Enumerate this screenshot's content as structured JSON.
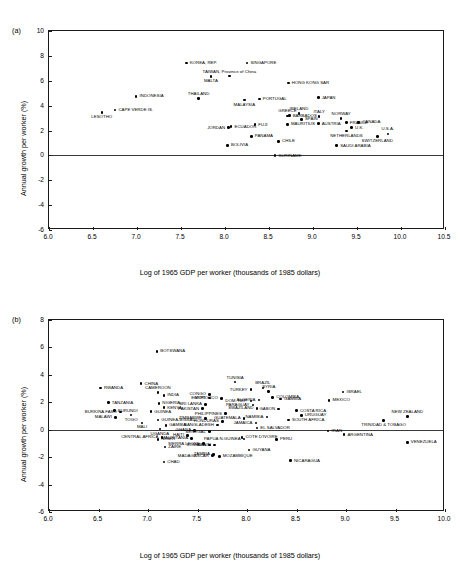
{
  "figure": {
    "panels": [
      {
        "tag": "(a)",
        "xlabel": "Log of 1965 GDP per worker (thousands of 1985 dollars)",
        "ylabel": "Annual growth per worker (%)"
      },
      {
        "tag": "(b)",
        "xlabel": "Log of 1965 GDP per worker (thousands of 1985 dollars)",
        "ylabel": "Annual growth per worker (%)"
      }
    ]
  },
  "chart_data": [
    {
      "type": "scatter",
      "panel": "(a)",
      "title": "",
      "xlabel": "Log of 1965 GDP per worker (thousands of 1985 dollars)",
      "ylabel": "Annual growth per worker (%)",
      "xlim": [
        6.0,
        10.5
      ],
      "ylim": [
        -6,
        10
      ],
      "xticks": [
        "6.0",
        "6.5",
        "7.0",
        "7.5",
        "8.0",
        "8.5",
        "9.0",
        "9.5",
        "10.0",
        "10.5"
      ],
      "yticks": [
        "-6",
        "-4",
        "-2",
        "0",
        "2",
        "4",
        "6",
        "8",
        "10"
      ],
      "grid": false,
      "legend": "none",
      "zero_line": 0,
      "points": [
        {
          "label": "LESOTHO",
          "x": 6.6,
          "y": 3.45,
          "pos": "below"
        },
        {
          "label": "CAPE VERDE IS.",
          "x": 6.75,
          "y": 3.65,
          "pos": "right"
        },
        {
          "label": "INDONESIA",
          "x": 6.99,
          "y": 4.75,
          "pos": "right"
        },
        {
          "label": "THAILAND",
          "x": 7.7,
          "y": 4.55,
          "pos": "above"
        },
        {
          "label": "KOREA, REP.",
          "x": 7.56,
          "y": 7.42,
          "pos": "right"
        },
        {
          "label": "MALTA",
          "x": 7.84,
          "y": 6.32,
          "pos": "below"
        },
        {
          "label": "TAIWAN, Province of China",
          "x": 8.05,
          "y": 6.37,
          "pos": "above"
        },
        {
          "label": "SINGAPORE",
          "x": 8.25,
          "y": 7.43,
          "pos": "right"
        },
        {
          "label": "MALAYSIA",
          "x": 8.22,
          "y": 4.45,
          "pos": "below"
        },
        {
          "label": "PORTUGAL",
          "x": 8.39,
          "y": 4.52,
          "pos": "right"
        },
        {
          "label": "JORDAN",
          "x": 8.04,
          "y": 2.22,
          "pos": "left"
        },
        {
          "label": "ECUADOR",
          "x": 8.07,
          "y": 2.3,
          "pos": "right"
        },
        {
          "label": "FUJI",
          "x": 8.34,
          "y": 2.47,
          "pos": "right"
        },
        {
          "label": "PANAMA",
          "x": 8.3,
          "y": 1.52,
          "pos": "right"
        },
        {
          "label": "BOLIVIA",
          "x": 8.03,
          "y": 0.8,
          "pos": "right"
        },
        {
          "label": "GREECE",
          "x": 8.71,
          "y": 3.18,
          "pos": "above"
        },
        {
          "label": "BARBADOS",
          "x": 8.73,
          "y": 3.2,
          "pos": "right"
        },
        {
          "label": "MAURITIUS",
          "x": 8.71,
          "y": 2.5,
          "pos": "right"
        },
        {
          "label": "CHILE",
          "x": 8.61,
          "y": 1.12,
          "pos": "right"
        },
        {
          "label": "SURINAME",
          "x": 8.57,
          "y": -0.02,
          "pos": "right"
        },
        {
          "label": "HONG KONG SAR",
          "x": 8.72,
          "y": 5.82,
          "pos": "right"
        },
        {
          "label": "JAPAN",
          "x": 9.06,
          "y": 4.63,
          "pos": "right"
        },
        {
          "label": "IRELAND",
          "x": 8.84,
          "y": 3.38,
          "pos": "above"
        },
        {
          "label": "SPAIN",
          "x": 8.87,
          "y": 2.9,
          "pos": "right"
        },
        {
          "label": "ITALY",
          "x": 9.07,
          "y": 3.12,
          "pos": "above"
        },
        {
          "label": "AUSTRIA",
          "x": 9.06,
          "y": 2.55,
          "pos": "right"
        },
        {
          "label": "NORWAY",
          "x": 9.32,
          "y": 2.98,
          "pos": "above"
        },
        {
          "label": "FRANCE",
          "x": 9.38,
          "y": 2.63,
          "pos": "right"
        },
        {
          "label": "CANADA",
          "x": 9.52,
          "y": 2.65,
          "pos": "right"
        },
        {
          "label": "NETHERLANDS",
          "x": 9.38,
          "y": 1.95,
          "pos": "below"
        },
        {
          "label": "U.K.",
          "x": 9.44,
          "y": 2.22,
          "pos": "right"
        },
        {
          "label": "U.S.A.",
          "x": 9.85,
          "y": 1.72,
          "pos": "above"
        },
        {
          "label": "SWITZERLAND",
          "x": 9.73,
          "y": 1.53,
          "pos": "below"
        },
        {
          "label": "SAUDI ARABIA",
          "x": 9.27,
          "y": 0.78,
          "pos": "right"
        }
      ]
    },
    {
      "type": "scatter",
      "panel": "(b)",
      "title": "",
      "xlabel": "Log of 1965 GDP per worker (thousands of 1985 dollars)",
      "ylabel": "Annual growth per worker (%)",
      "xlim": [
        6.0,
        10.0
      ],
      "ylim": [
        -6,
        8
      ],
      "xticks": [
        "6.0",
        "6.5",
        "7.0",
        "7.5",
        "8.0",
        "8.5",
        "9.0",
        "9.5",
        "10.0"
      ],
      "yticks": [
        "-6",
        "-4",
        "-2",
        "0",
        "2",
        "4",
        "6",
        "8"
      ],
      "grid": false,
      "legend": "none",
      "zero_line": 0,
      "points": [
        {
          "label": "BOTSWANA",
          "x": 7.09,
          "y": 5.72,
          "pos": "right"
        },
        {
          "label": "RWANDA",
          "x": 6.52,
          "y": 3.05,
          "pos": "right"
        },
        {
          "label": "CHINA",
          "x": 6.93,
          "y": 3.36,
          "pos": "right"
        },
        {
          "label": "TANZANIA",
          "x": 6.6,
          "y": 1.97,
          "pos": "right"
        },
        {
          "label": "BURKINA FASO",
          "x": 6.72,
          "y": 1.3,
          "pos": "left"
        },
        {
          "label": "BURUNDI",
          "x": 6.66,
          "y": 1.4,
          "pos": "right"
        },
        {
          "label": "MALAWI",
          "x": 6.67,
          "y": 0.9,
          "pos": "left"
        },
        {
          "label": "TOGO",
          "x": 6.83,
          "y": 1.08,
          "pos": "below"
        },
        {
          "label": "MALI",
          "x": 6.94,
          "y": 0.5,
          "pos": "below"
        },
        {
          "label": "CAMEROON",
          "x": 7.1,
          "y": 2.7,
          "pos": "above"
        },
        {
          "label": "INDIA",
          "x": 7.16,
          "y": 2.5,
          "pos": "right"
        },
        {
          "label": "NIGERIA",
          "x": 7.11,
          "y": 1.92,
          "pos": "right"
        },
        {
          "label": "KENYA",
          "x": 7.16,
          "y": 1.6,
          "pos": "right"
        },
        {
          "label": "GUINEA",
          "x": 7.03,
          "y": 1.32,
          "pos": "right"
        },
        {
          "label": "GUINEA-BISSAU",
          "x": 7.1,
          "y": 0.72,
          "pos": "right"
        },
        {
          "label": "GAMBIA",
          "x": 7.18,
          "y": 0.32,
          "pos": "right"
        },
        {
          "label": "UGANDA",
          "x": 7.12,
          "y": 0.05,
          "pos": "below"
        },
        {
          "label": "CENTRAL AFRICA",
          "x": 7.14,
          "y": -0.55,
          "pos": "left"
        },
        {
          "label": "NIGER",
          "x": 7.1,
          "y": -0.7,
          "pos": "right"
        },
        {
          "label": "ZAIRE",
          "x": 7.17,
          "y": -1.25,
          "pos": "right"
        },
        {
          "label": "CHAD",
          "x": 7.16,
          "y": -2.35,
          "pos": "right"
        },
        {
          "label": "SRI LANKA",
          "x": 7.58,
          "y": 1.85,
          "pos": "left"
        },
        {
          "label": "PAKISTAN",
          "x": 7.55,
          "y": 1.53,
          "pos": "left"
        },
        {
          "label": "ZIMBABWE",
          "x": 7.58,
          "y": 0.82,
          "pos": "left"
        },
        {
          "label": "CONGO",
          "x": 7.62,
          "y": 2.58,
          "pos": "left"
        },
        {
          "label": "EGYPT",
          "x": 7.62,
          "y": 2.3,
          "pos": "left"
        },
        {
          "label": "MOROCCO",
          "x": 7.74,
          "y": 2.28,
          "pos": "left"
        },
        {
          "label": "HAITI",
          "x": 7.4,
          "y": -0.42,
          "pos": "left"
        },
        {
          "label": "MAURITANIA",
          "x": 7.44,
          "y": -0.62,
          "pos": "left"
        },
        {
          "label": "GHANA",
          "x": 7.47,
          "y": -0.05,
          "pos": "left"
        },
        {
          "label": "SENEGAL",
          "x": 7.62,
          "y": -0.15,
          "pos": "left"
        },
        {
          "label": "SIERRA LEONE",
          "x": 7.56,
          "y": -1.02,
          "pos": "left"
        },
        {
          "label": "SOMALIA",
          "x": 7.62,
          "y": -1.1,
          "pos": "left"
        },
        {
          "label": "BENIN",
          "x": 7.67,
          "y": -1.1,
          "pos": "left"
        },
        {
          "label": "MADAGASCAR",
          "x": 7.65,
          "y": -1.9,
          "pos": "left"
        },
        {
          "label": "ZAMBIA",
          "x": 7.66,
          "y": -1.8,
          "pos": "left"
        },
        {
          "label": "MOZAMBIQUE",
          "x": 7.72,
          "y": -1.95,
          "pos": "right"
        },
        {
          "label": "TUNISIA",
          "x": 7.88,
          "y": 3.47,
          "pos": "above"
        },
        {
          "label": "PHILIPPINES",
          "x": 7.78,
          "y": 1.18,
          "pos": "left"
        },
        {
          "label": "HONDURAS",
          "x": 7.75,
          "y": 0.62,
          "pos": "left"
        },
        {
          "label": "BANGLADESH",
          "x": 7.7,
          "y": 0.35,
          "pos": "left"
        },
        {
          "label": "TURKEY",
          "x": 8.04,
          "y": 2.92,
          "pos": "left"
        },
        {
          "label": "BRAZIL",
          "x": 8.16,
          "y": 3.05,
          "pos": "above"
        },
        {
          "label": "SYRIA",
          "x": 8.22,
          "y": 2.8,
          "pos": "above"
        },
        {
          "label": "COLOMBIA",
          "x": 8.26,
          "y": 2.35,
          "pos": "right"
        },
        {
          "label": "GAMBIA2",
          "x": 8.34,
          "y": 2.25,
          "pos": "right"
        },
        {
          "label": "DOM. REP.",
          "x": 8.04,
          "y": 2.1,
          "pos": "left"
        },
        {
          "label": "ALGERIA",
          "x": 8.12,
          "y": 2.18,
          "pos": "left"
        },
        {
          "label": "PARAGUAY",
          "x": 8.06,
          "y": 1.8,
          "pos": "left"
        },
        {
          "label": "SWAZILAND",
          "x": 8.1,
          "y": 1.55,
          "pos": "left"
        },
        {
          "label": "GABON",
          "x": 8.32,
          "y": 1.52,
          "pos": "left"
        },
        {
          "label": "GUATEMALA",
          "x": 7.97,
          "y": 0.82,
          "pos": "left"
        },
        {
          "label": "NAMIBIA",
          "x": 8.2,
          "y": 0.92,
          "pos": "left"
        },
        {
          "label": "JAMAICA",
          "x": 8.09,
          "y": 0.48,
          "pos": "left"
        },
        {
          "label": "EL SALVADOR",
          "x": 8.1,
          "y": 0.12,
          "pos": "right"
        },
        {
          "label": "COSTA RICA",
          "x": 8.5,
          "y": 1.38,
          "pos": "right"
        },
        {
          "label": "URUGUAY",
          "x": 8.55,
          "y": 1.05,
          "pos": "right"
        },
        {
          "label": "SOUTH AFRICA",
          "x": 8.42,
          "y": 0.72,
          "pos": "right"
        },
        {
          "label": "COTE D'IVOIRE",
          "x": 7.95,
          "y": -0.55,
          "pos": "right"
        },
        {
          "label": "PAPUA N.GUINEA",
          "x": 7.97,
          "y": -0.68,
          "pos": "left"
        },
        {
          "label": "GUYANA",
          "x": 8.02,
          "y": -1.48,
          "pos": "right"
        },
        {
          "label": "PERU",
          "x": 8.3,
          "y": -0.7,
          "pos": "right"
        },
        {
          "label": "NICARAGUA",
          "x": 8.44,
          "y": -2.25,
          "pos": "right"
        },
        {
          "label": "ISRAEL",
          "x": 8.97,
          "y": 2.75,
          "pos": "right"
        },
        {
          "label": "MEXICO",
          "x": 8.83,
          "y": 2.15,
          "pos": "right"
        },
        {
          "label": "IRAN",
          "x": 8.82,
          "y": -0.1,
          "pos": "right"
        },
        {
          "label": "ARGENTINA",
          "x": 8.98,
          "y": -0.35,
          "pos": "right"
        },
        {
          "label": "NEW ZEALAND",
          "x": 9.62,
          "y": 0.95,
          "pos": "above"
        },
        {
          "label": "TRINIDAD & TOBAGO",
          "x": 9.38,
          "y": 0.68,
          "pos": "below"
        },
        {
          "label": "VENEZUELA",
          "x": 9.62,
          "y": -0.92,
          "pos": "right"
        }
      ]
    }
  ]
}
